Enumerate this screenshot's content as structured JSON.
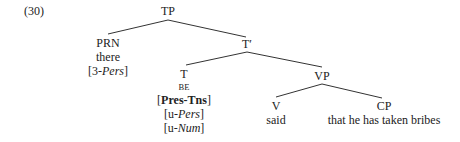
{
  "example_number": "(30)",
  "tree": {
    "root": "TP",
    "prn": {
      "label": "PRN",
      "word": "there",
      "feature_prefix": "[3-",
      "feature_italic": "Pers",
      "feature_suffix": "]"
    },
    "tbar": "T′",
    "t": {
      "label": "T",
      "word": "BE",
      "features": [
        {
          "prefix": "[",
          "bold": "Pres-Tns",
          "suffix": "]"
        },
        {
          "prefix": "[u-",
          "italic": "Pers",
          "suffix": "]"
        },
        {
          "prefix": "[u-",
          "italic": "Num",
          "suffix": "]"
        }
      ]
    },
    "vp": "VP",
    "v": {
      "label": "V",
      "word": "said"
    },
    "cp": {
      "label": "CP",
      "text": "that he has taken bribes"
    }
  }
}
